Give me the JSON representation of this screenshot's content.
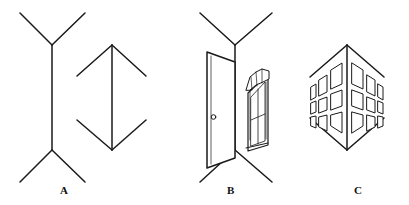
{
  "figure": {
    "stroke_color": "#1a1a1a",
    "fill_color": "#ffffff",
    "background": "#ffffff",
    "panels": [
      {
        "id": "A",
        "label": "A",
        "label_x": 60,
        "label_y": 185,
        "description": "Muller-Lyer figure: two equal vertical lines, left with outward fins, right with inward fins",
        "shapes": [
          {
            "name": "outward-fins-line",
            "shaft": {
              "x1": 52,
              "y1": 45,
              "x2": 52,
              "y2": 150
            },
            "fins": [
              {
                "x1": 52,
                "y1": 45,
                "x2": 20,
                "y2": 13
              },
              {
                "x1": 52,
                "y1": 45,
                "x2": 85,
                "y2": 13
              },
              {
                "x1": 52,
                "y1": 150,
                "x2": 20,
                "y2": 182
              },
              {
                "x1": 52,
                "y1": 150,
                "x2": 85,
                "y2": 182
              }
            ]
          },
          {
            "name": "inward-fins-line",
            "shaft": {
              "x1": 112,
              "y1": 45,
              "x2": 112,
              "y2": 150
            },
            "fins": [
              {
                "x1": 112,
                "y1": 45,
                "x2": 77,
                "y2": 76
              },
              {
                "x1": 112,
                "y1": 45,
                "x2": 146,
                "y2": 76
              },
              {
                "x1": 112,
                "y1": 150,
                "x2": 77,
                "y2": 120
              },
              {
                "x1": 112,
                "y1": 150,
                "x2": 146,
                "y2": 120
              }
            ]
          }
        ]
      },
      {
        "id": "B",
        "label": "B",
        "label_x": 227,
        "label_y": 185,
        "description": "Inside corner of a room: near vertical edge with receding wall lines, a door on the left wall and a curtained window on the right wall",
        "shapes": [
          {
            "name": "room-corner-edge",
            "shaft": {
              "x1": 235,
              "y1": 45,
              "x2": 235,
              "y2": 150
            },
            "fins": [
              {
                "x1": 235,
                "y1": 45,
                "x2": 200,
                "y2": 13
              },
              {
                "x1": 235,
                "y1": 45,
                "x2": 272,
                "y2": 13
              },
              {
                "x1": 235,
                "y1": 150,
                "x2": 200,
                "y2": 182
              },
              {
                "x1": 235,
                "y1": 150,
                "x2": 272,
                "y2": 182
              }
            ]
          },
          {
            "name": "door",
            "outline": "207,52 235,62 235,158 207,168",
            "knob": {
              "cx": 213,
              "cy": 117,
              "r": 2.4
            }
          },
          {
            "name": "window-with-curtains",
            "frame": "248,92 268,74 268,145 248,150"
          }
        ]
      },
      {
        "id": "C",
        "label": "C",
        "label_x": 354,
        "label_y": 185,
        "description": "Outside corner of a building: near vertical edge projecting toward viewer, rows of windows receding on both faces",
        "shapes": [
          {
            "name": "building-corner-edge",
            "shaft": {
              "x1": 347,
              "y1": 45,
              "x2": 347,
              "y2": 150
            },
            "fins": [
              {
                "x1": 347,
                "y1": 45,
                "x2": 310,
                "y2": 77
              },
              {
                "x1": 347,
                "y1": 45,
                "x2": 384,
                "y2": 77
              },
              {
                "x1": 347,
                "y1": 150,
                "x2": 310,
                "y2": 118
              },
              {
                "x1": 347,
                "y1": 150,
                "x2": 384,
                "y2": 118
              }
            ]
          },
          {
            "name": "window-grid-left-face",
            "rows": 3,
            "columns": 3
          },
          {
            "name": "window-grid-right-face",
            "rows": 3,
            "columns": 3
          }
        ]
      }
    ]
  }
}
